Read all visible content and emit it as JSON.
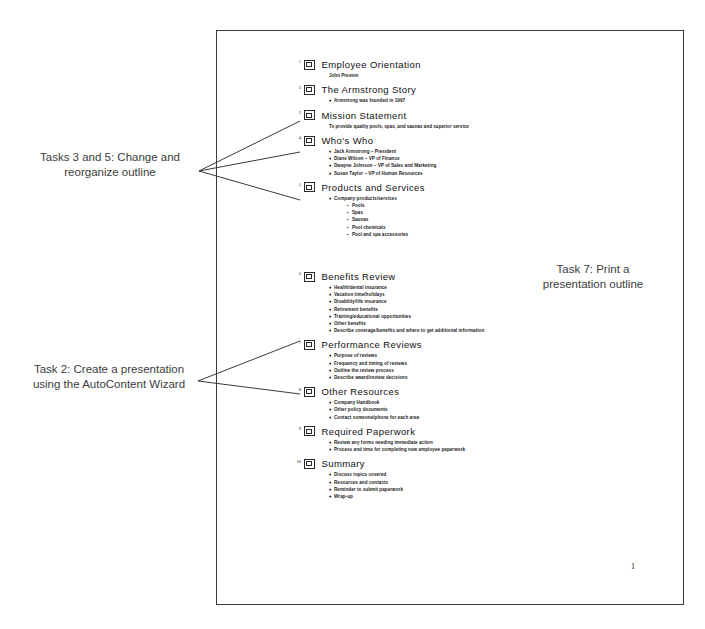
{
  "document": {
    "page_number": "1"
  },
  "annotations": [
    {
      "id": "tasks-3-and-5",
      "text": "Tasks 3 and 5: Change and\nreorganize outline"
    },
    {
      "id": "task-2",
      "text": "Task 2: Create a presentation\nusing the AutoContent Wizard"
    },
    {
      "id": "task-7",
      "text": "Task 7: Print a\npresentation outline"
    }
  ],
  "outline": {
    "slides": [
      {
        "number": "1",
        "title": "Employee Orientation",
        "subtitle": "John Preston",
        "bullets": []
      },
      {
        "number": "2",
        "title": "The Armstrong Story",
        "bullets": [
          {
            "level": 1,
            "text": "Armstrong was founded in 1997"
          }
        ]
      },
      {
        "number": "3",
        "title": "Mission Statement",
        "subtitle": "To provide quality pools, spas, and saunas and superior service",
        "bullets": []
      },
      {
        "number": "4",
        "title": "Who's Who",
        "bullets": [
          {
            "level": 1,
            "text": "Jack Armstrong – President"
          },
          {
            "level": 1,
            "text": "Diane Wilson – VP of Finance"
          },
          {
            "level": 1,
            "text": "Dwayne Johnson – VP of Sales and Marketing"
          },
          {
            "level": 1,
            "text": "Susan Taylor – VP of Human Resources"
          }
        ]
      },
      {
        "number": "5",
        "title": "Products and Services",
        "bullets": [
          {
            "level": 1,
            "text": "Company products/services"
          },
          {
            "level": 2,
            "text": "Pools"
          },
          {
            "level": 2,
            "text": "Spas"
          },
          {
            "level": 2,
            "text": "Saunas"
          },
          {
            "level": 2,
            "text": "Pool chemicals"
          },
          {
            "level": 2,
            "text": "Pool and spa accessories"
          }
        ]
      },
      {
        "number": "6",
        "title": "Benefits Review",
        "bullets": [
          {
            "level": 1,
            "text": "Health/dental insurance"
          },
          {
            "level": 1,
            "text": "Vacation time/holidays"
          },
          {
            "level": 1,
            "text": "Disability/life insurance"
          },
          {
            "level": 1,
            "text": "Retirement benefits"
          },
          {
            "level": 1,
            "text": "Training/educational opportunities"
          },
          {
            "level": 1,
            "text": "Other benefits"
          },
          {
            "level": 1,
            "text": "Describe coverage/benefits and where to get additional information"
          }
        ]
      },
      {
        "number": "7",
        "title": "Performance Reviews",
        "bullets": [
          {
            "level": 1,
            "text": "Purpose of reviews"
          },
          {
            "level": 1,
            "text": "Frequency and timing of reviews"
          },
          {
            "level": 1,
            "text": "Outline the review process"
          },
          {
            "level": 1,
            "text": "Describe award/review decisions"
          }
        ]
      },
      {
        "number": "8",
        "title": "Other Resources",
        "bullets": [
          {
            "level": 1,
            "text": "Company Handbook"
          },
          {
            "level": 1,
            "text": "Other policy documents"
          },
          {
            "level": 1,
            "text": "Contact someone/phone for each area"
          }
        ]
      },
      {
        "number": "9",
        "title": "Required Paperwork",
        "bullets": [
          {
            "level": 1,
            "text": "Review any forms needing immediate action"
          },
          {
            "level": 1,
            "text": "Process and time for completing new employee paperwork"
          }
        ]
      },
      {
        "number": "10",
        "title": "Summary",
        "bullets": [
          {
            "level": 1,
            "text": "Discuss topics covered"
          },
          {
            "level": 1,
            "text": "Resources and contacts"
          },
          {
            "level": 1,
            "text": "Reminder to submit paperwork"
          },
          {
            "level": 1,
            "text": "Wrap-up"
          }
        ]
      }
    ]
  }
}
